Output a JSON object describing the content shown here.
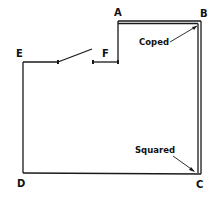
{
  "diagram": {
    "points": {
      "A": "A",
      "B": "B",
      "C": "C",
      "D": "D",
      "E": "E",
      "F": "F"
    },
    "annotations": {
      "coped": "Coped",
      "squared": "Squared"
    },
    "colors": {
      "line": "#1a1a1a",
      "background": "#ffffff"
    }
  }
}
